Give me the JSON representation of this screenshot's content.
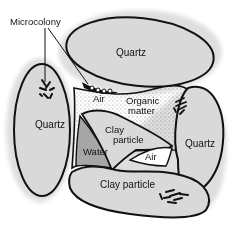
{
  "diagram": {
    "labels": {
      "microcolony": "Microcolony",
      "quartz_top": "Quartz",
      "quartz_left": "Quartz",
      "quartz_right": "Quartz",
      "air_top": "Air",
      "organic_line1": "Organic",
      "organic_line2": "matter",
      "clay_center_line1": "Clay",
      "clay_center_line2": "particle",
      "water": "Water",
      "air_bottom": "Air",
      "clay_bottom": "Clay particle"
    },
    "colors": {
      "particle_fill": "#d9d9d9",
      "water_fill": "#a6a6a6",
      "outline": "#111111",
      "background": "#ffffff",
      "stipple": "#222222"
    }
  }
}
